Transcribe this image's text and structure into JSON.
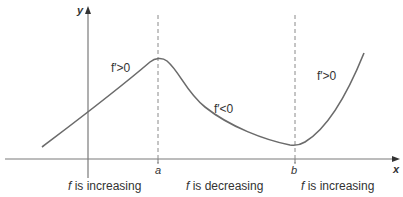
{
  "diagram": {
    "title": "",
    "colors": {
      "curve": "#6b6b6b",
      "axes": "#7a7a7a",
      "dashed": "#8a8a8a",
      "text": "#333333"
    },
    "axes": {
      "x_label": "x",
      "y_label": "y"
    },
    "points": {
      "a_label": "a",
      "b_label": "b"
    },
    "derivative_labels": {
      "left": "f′>0",
      "middle": "f′<0",
      "right": "f′>0"
    },
    "region_labels": [
      {
        "f": "f",
        "text": " is increasing"
      },
      {
        "f": "f",
        "text": " is decreasing"
      },
      {
        "f": "f",
        "text": " is increasing"
      }
    ]
  }
}
